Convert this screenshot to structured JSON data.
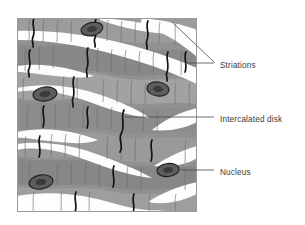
{
  "figure": {
    "frame": {
      "x": 17,
      "y": 18,
      "width": 180,
      "height": 194
    },
    "colors": {
      "background": "#ffffff",
      "fiber_fill": "#919191",
      "fiber_fill_light": "#a8a8a8",
      "fiber_fill_dark": "#7d7d7d",
      "interstitial": "#fdfdfd",
      "striation_line": "#6b6b6b",
      "intercalated_disk_line": "#1a1a1a",
      "nucleus_fill": "#5a5a5a",
      "nucleus_outline": "#232323",
      "frame_border": "#9a9a9a",
      "label_text": "#3a3a3a",
      "leader_line": "#4a4a4a"
    },
    "labels": [
      {
        "id": "striations",
        "text": "Striations",
        "text_x": 220,
        "text_y": 65,
        "leaders": [
          {
            "points": "172,22 214,62"
          },
          {
            "points": "185,63 214,63"
          }
        ]
      },
      {
        "id": "intercalated-disk",
        "text": "Intercalated disk",
        "text_x": 220,
        "text_y": 118,
        "leaders": [
          {
            "points": "125,117 214,117"
          }
        ]
      },
      {
        "id": "nucleus",
        "text": "Nucleus",
        "text_x": 220,
        "text_y": 172,
        "leaders": [
          {
            "points": "178,170 214,170"
          }
        ]
      }
    ],
    "nuclei": [
      {
        "id": "nucleus-1",
        "cx": 92,
        "cy": 29,
        "rx": 11,
        "ry": 6.5,
        "rotate": -12
      },
      {
        "id": "nucleus-2",
        "cx": 45,
        "cy": 94,
        "rx": 12,
        "ry": 7,
        "rotate": -8
      },
      {
        "id": "nucleus-3",
        "cx": 158,
        "cy": 89,
        "rx": 11,
        "ry": 7,
        "rotate": 8
      },
      {
        "id": "nucleus-4",
        "cx": 168,
        "cy": 170,
        "rx": 11,
        "ry": 6.5,
        "rotate": -6
      },
      {
        "id": "nucleus-5",
        "cx": 41,
        "cy": 182,
        "rx": 12,
        "ry": 7,
        "rotate": -10
      }
    ],
    "fiber_bands": [
      {
        "id": "band-1",
        "fill": "#919191"
      },
      {
        "id": "band-2",
        "fill": "#9b9b9b"
      },
      {
        "id": "band-3",
        "fill": "#8a8a8a"
      },
      {
        "id": "band-4",
        "fill": "#9b9b9b"
      },
      {
        "id": "band-5",
        "fill": "#8f8f8f"
      },
      {
        "id": "band-6",
        "fill": "#a0a0a0"
      },
      {
        "id": "band-7",
        "fill": "#8a8a8a"
      }
    ],
    "interstitial_spaces": [
      {
        "id": "space-1"
      },
      {
        "id": "space-2"
      },
      {
        "id": "space-3"
      },
      {
        "id": "space-4"
      },
      {
        "id": "space-5"
      },
      {
        "id": "space-6"
      },
      {
        "id": "space-7"
      },
      {
        "id": "space-8"
      }
    ]
  }
}
